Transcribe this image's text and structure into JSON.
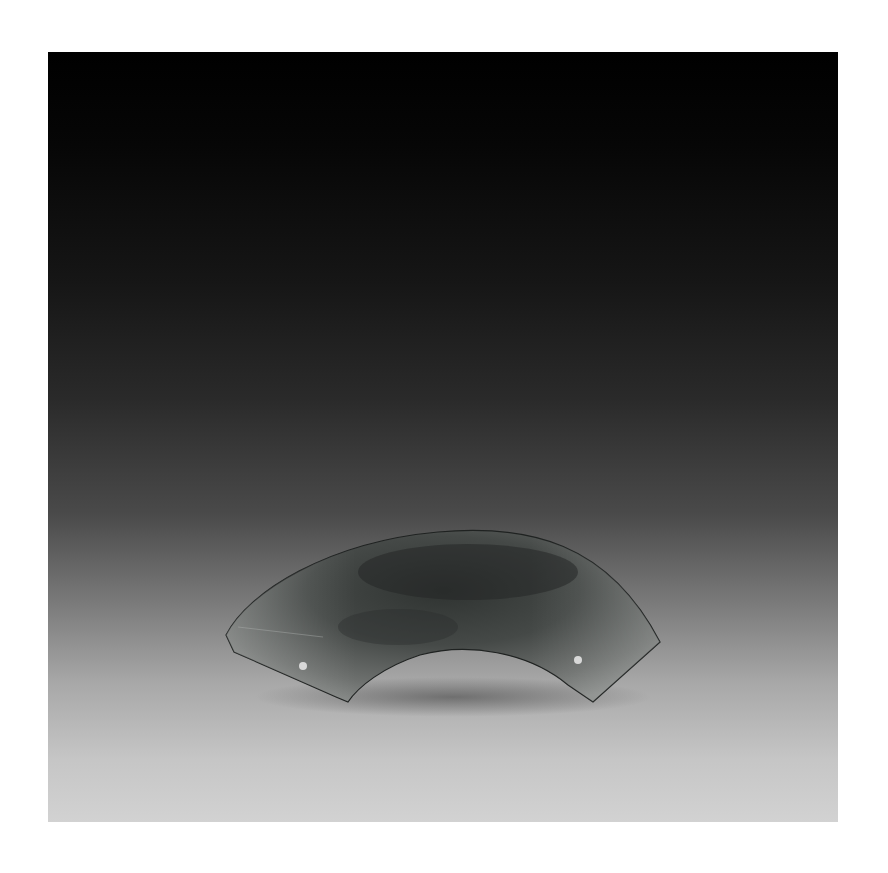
{
  "image": {
    "subject": "jade arc-shaped pendant (huang) with two drilled holes",
    "background": "black-to-light-gray vertical gradient studio backdrop",
    "colors": {
      "top": "#000000",
      "middle": "#2a2a2a",
      "bottom": "#d2d2d2",
      "artifact_dark": "#2b2f2e",
      "artifact_light": "#8a8d8b",
      "holes": "#d8d8d8"
    }
  }
}
